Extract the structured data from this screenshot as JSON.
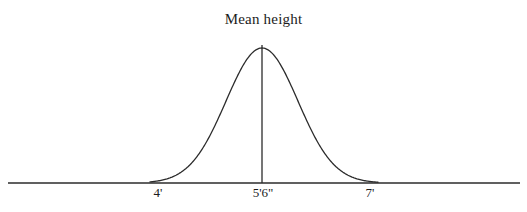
{
  "figure": {
    "background_color": "#ffffff",
    "ink_color": "#2b2b2b",
    "text_color": "#1c1c1c"
  },
  "chart_data": {
    "type": "line",
    "title": "Mean height",
    "subtitle": "",
    "xlabel": "",
    "ylabel": "",
    "annotations": [
      {
        "name": "mean-line",
        "label": "Mean height",
        "x": "5'6\"",
        "style": "vertical line at distribution peak"
      }
    ],
    "axis": {
      "grid": false,
      "legend": false,
      "y_axis_visible": false,
      "x_axis_visible": true,
      "tick_labels": [
        "4'",
        "5'6\"",
        "7'"
      ],
      "tick_positions_px": [
        158,
        263,
        370
      ],
      "axis_line_y_px": 183,
      "axis_line_x_start_px": 8,
      "axis_line_x_end_px": 520
    },
    "distribution": {
      "shape": "normal",
      "mean_label": "5'6\"",
      "peak_x_px": 262,
      "peak_y_px": 48,
      "baseline_y_px": 183,
      "left_tail_x_px": 150,
      "right_tail_x_px": 378,
      "sigma_px": 36
    },
    "x": [
      150,
      158,
      166,
      174,
      182,
      190,
      198,
      206,
      214,
      222,
      230,
      238,
      246,
      254,
      262,
      270,
      278,
      286,
      294,
      302,
      310,
      318,
      326,
      334,
      342,
      350,
      358,
      366,
      374,
      378
    ],
    "values": [
      0.003,
      0.009,
      0.023,
      0.052,
      0.105,
      0.189,
      0.306,
      0.449,
      0.606,
      0.753,
      0.877,
      0.959,
      0.997,
      1.0,
      1.0,
      0.997,
      0.959,
      0.877,
      0.753,
      0.606,
      0.449,
      0.306,
      0.189,
      0.105,
      0.052,
      0.023,
      0.009,
      0.003,
      0.001,
      0.0
    ]
  }
}
